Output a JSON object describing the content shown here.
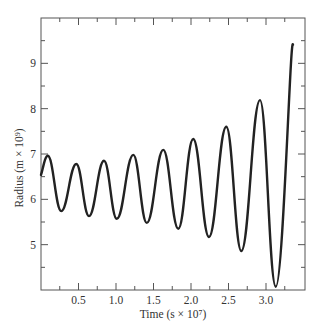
{
  "chart_data": {
    "type": "line",
    "title": "",
    "xlabel": "Time (s × 10⁷)",
    "ylabel": "Radius (m × 10⁹)",
    "xlim": [
      0,
      3.5
    ],
    "ylim": [
      4,
      10
    ],
    "x_ticks": [
      0.5,
      1.0,
      1.5,
      2.0,
      2.5,
      3.0
    ],
    "x_tick_labels": [
      "0.5",
      "1.0",
      "1.5",
      "2.0",
      "2.5",
      "3.0"
    ],
    "x_minor_ticks": [
      0.25,
      0.75,
      1.25,
      1.75,
      2.25,
      2.75,
      3.25
    ],
    "y_ticks": [
      5,
      6,
      7,
      8,
      9
    ],
    "y_tick_labels": [
      "5",
      "6",
      "7",
      "8",
      "9"
    ],
    "y_minor_ticks": [
      4.5,
      5.5,
      6.5,
      7.5,
      8.5,
      9.5
    ],
    "grid": false,
    "legend": null,
    "series": [
      {
        "name": "Radius",
        "color": "#222222",
        "x": [
          0.0,
          0.09,
          0.27,
          0.47,
          0.64,
          0.84,
          1.01,
          1.23,
          1.41,
          1.63,
          1.83,
          2.03,
          2.24,
          2.47,
          2.67,
          2.92,
          3.13,
          3.36
        ],
        "y": [
          6.54,
          6.96,
          5.74,
          6.78,
          5.63,
          6.85,
          5.57,
          6.98,
          5.48,
          7.09,
          5.35,
          7.33,
          5.17,
          7.6,
          4.86,
          8.19,
          4.07,
          9.41
        ]
      }
    ]
  }
}
